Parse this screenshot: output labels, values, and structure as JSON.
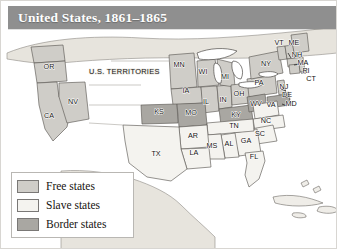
{
  "figure": {
    "kind": "historical-thematic-map",
    "title": "United States, 1861–1865",
    "title_bar_color": "#8f8f8f",
    "title_text_color": "#ffffff",
    "page_background": "#ffffff",
    "border_color": "#d8d6d2"
  },
  "map": {
    "ocean_color": "#ffffff",
    "land_outside_us_color": "#e7e4dd",
    "lake_color": "#ffffff",
    "outline_color": "#5d5a55",
    "territories_label": "U.S. TERRITORIES",
    "colors": {
      "free": "#cfcdc8",
      "slave": "#f4f3ef",
      "border": "#a9a7a2"
    }
  },
  "legend": {
    "items": [
      {
        "label": "Free states",
        "color": "#cfcdc8"
      },
      {
        "label": "Slave states",
        "color": "#f4f3ef"
      },
      {
        "label": "Border states",
        "color": "#a9a7a2"
      }
    ]
  },
  "chart_data": {
    "type": "map",
    "title": "United States, 1861–1865",
    "legend": [
      "Free states",
      "Slave states",
      "Border states"
    ],
    "categories": [
      "free",
      "slave",
      "border"
    ],
    "annotations": [
      "U.S. TERRITORIES"
    ],
    "states": [
      {
        "abbr": "OR",
        "category": "free",
        "x": 48,
        "y": 68
      },
      {
        "abbr": "NV",
        "category": "free",
        "x": 72,
        "y": 103
      },
      {
        "abbr": "CA",
        "category": "free",
        "x": 48,
        "y": 117
      },
      {
        "abbr": "MN",
        "category": "free",
        "x": 178,
        "y": 66
      },
      {
        "abbr": "WI",
        "category": "free",
        "x": 202,
        "y": 73
      },
      {
        "abbr": "IA",
        "category": "free",
        "x": 185,
        "y": 92
      },
      {
        "abbr": "IL",
        "category": "free",
        "x": 205,
        "y": 103
      },
      {
        "abbr": "IN",
        "category": "free",
        "x": 222,
        "y": 101
      },
      {
        "abbr": "MI",
        "category": "free",
        "x": 224,
        "y": 78
      },
      {
        "abbr": "OH",
        "category": "free",
        "x": 238,
        "y": 95
      },
      {
        "abbr": "PA",
        "category": "free",
        "x": 258,
        "y": 84
      },
      {
        "abbr": "NY",
        "category": "free",
        "x": 265,
        "y": 65
      },
      {
        "abbr": "VT",
        "category": "free",
        "x": 278,
        "y": 44
      },
      {
        "abbr": "NH",
        "category": "free",
        "x": 296,
        "y": 56
      },
      {
        "abbr": "ME",
        "category": "free",
        "x": 293,
        "y": 44
      },
      {
        "abbr": "MA",
        "category": "free",
        "x": 302,
        "y": 64
      },
      {
        "abbr": "RI",
        "category": "free",
        "x": 305,
        "y": 72
      },
      {
        "abbr": "CT",
        "category": "free",
        "x": 310,
        "y": 80
      },
      {
        "abbr": "NJ",
        "category": "free",
        "x": 283,
        "y": 88
      },
      {
        "abbr": "KS",
        "category": "border",
        "x": 158,
        "y": 113
      },
      {
        "abbr": "MO",
        "category": "border",
        "x": 190,
        "y": 114
      },
      {
        "abbr": "KY",
        "category": "border",
        "x": 235,
        "y": 116
      },
      {
        "abbr": "WV",
        "category": "border",
        "x": 255,
        "y": 105
      },
      {
        "abbr": "DE",
        "category": "border",
        "x": 286,
        "y": 96
      },
      {
        "abbr": "MD",
        "category": "border",
        "x": 290,
        "y": 105
      },
      {
        "abbr": "VA",
        "category": "slave",
        "x": 270,
        "y": 106
      },
      {
        "abbr": "TN",
        "category": "slave",
        "x": 233,
        "y": 127
      },
      {
        "abbr": "NC",
        "category": "slave",
        "x": 265,
        "y": 122
      },
      {
        "abbr": "SC",
        "category": "slave",
        "x": 259,
        "y": 135
      },
      {
        "abbr": "GA",
        "category": "slave",
        "x": 245,
        "y": 142
      },
      {
        "abbr": "AL",
        "category": "slave",
        "x": 228,
        "y": 145
      },
      {
        "abbr": "MS",
        "category": "slave",
        "x": 211,
        "y": 147
      },
      {
        "abbr": "AR",
        "category": "slave",
        "x": 192,
        "y": 137
      },
      {
        "abbr": "LA",
        "category": "slave",
        "x": 193,
        "y": 154
      },
      {
        "abbr": "TX",
        "category": "slave",
        "x": 155,
        "y": 155
      },
      {
        "abbr": "FL",
        "category": "slave",
        "x": 253,
        "y": 158
      }
    ]
  }
}
